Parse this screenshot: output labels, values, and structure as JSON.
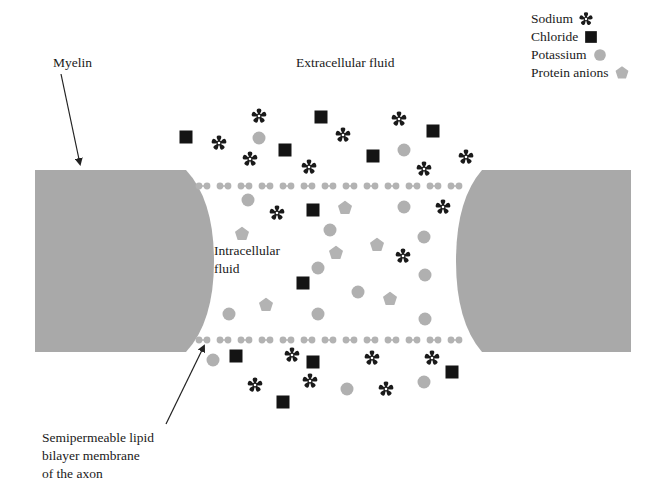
{
  "colors": {
    "myelin": "#a9a9a9",
    "membrane": "#b3b3b3",
    "sodium": "#1a1a1a",
    "chloride": "#141414",
    "potassium": "#b0b0b0",
    "protein": "#b3b3b3",
    "text": "#1a1a1a",
    "arrow": "#222222"
  },
  "labels": {
    "myelin": "Myelin",
    "extracellular": "Extracellular fluid",
    "intracellular_line1": "Intracellular",
    "intracellular_line2": "fluid",
    "membrane_line1": "Semipermeable lipid",
    "membrane_line2": "bilayer membrane",
    "membrane_line3": "of the axon"
  },
  "legend": {
    "items": [
      {
        "label": "Sodium",
        "symbol": "star"
      },
      {
        "label": "Chloride",
        "symbol": "square"
      },
      {
        "label": "Potassium",
        "symbol": "circle"
      },
      {
        "label": "Protein anions",
        "symbol": "pentagon"
      }
    ]
  },
  "particles": {
    "extracellular_top": [
      {
        "type": "square",
        "x": 186,
        "y": 137
      },
      {
        "type": "star",
        "x": 219,
        "y": 143
      },
      {
        "type": "star",
        "x": 259,
        "y": 116
      },
      {
        "type": "circle",
        "x": 259,
        "y": 138
      },
      {
        "type": "star",
        "x": 250,
        "y": 159
      },
      {
        "type": "square",
        "x": 285,
        "y": 150
      },
      {
        "type": "star",
        "x": 309,
        "y": 167
      },
      {
        "type": "square",
        "x": 321,
        "y": 117
      },
      {
        "type": "star",
        "x": 343,
        "y": 135
      },
      {
        "type": "square",
        "x": 373,
        "y": 156
      },
      {
        "type": "star",
        "x": 399,
        "y": 119
      },
      {
        "type": "square",
        "x": 433,
        "y": 131
      },
      {
        "type": "circle",
        "x": 404,
        "y": 150
      },
      {
        "type": "star",
        "x": 424,
        "y": 169
      },
      {
        "type": "star",
        "x": 466,
        "y": 157
      }
    ],
    "intracellular": [
      {
        "type": "circle",
        "x": 248,
        "y": 200
      },
      {
        "type": "star",
        "x": 277,
        "y": 213
      },
      {
        "type": "square",
        "x": 313,
        "y": 210
      },
      {
        "type": "pentagon",
        "x": 345,
        "y": 208
      },
      {
        "type": "circle",
        "x": 404,
        "y": 207
      },
      {
        "type": "star",
        "x": 443,
        "y": 207
      },
      {
        "type": "pentagon",
        "x": 242,
        "y": 234
      },
      {
        "type": "circle",
        "x": 330,
        "y": 230
      },
      {
        "type": "pentagon",
        "x": 377,
        "y": 245
      },
      {
        "type": "circle",
        "x": 424,
        "y": 237
      },
      {
        "type": "pentagon",
        "x": 336,
        "y": 253
      },
      {
        "type": "star",
        "x": 403,
        "y": 256
      },
      {
        "type": "circle",
        "x": 318,
        "y": 268
      },
      {
        "type": "circle",
        "x": 425,
        "y": 275
      },
      {
        "type": "square",
        "x": 303,
        "y": 283
      },
      {
        "type": "circle",
        "x": 358,
        "y": 292
      },
      {
        "type": "pentagon",
        "x": 390,
        "y": 299
      },
      {
        "type": "pentagon",
        "x": 266,
        "y": 305
      },
      {
        "type": "circle",
        "x": 229,
        "y": 314
      },
      {
        "type": "circle",
        "x": 318,
        "y": 314
      },
      {
        "type": "circle",
        "x": 425,
        "y": 319
      }
    ],
    "extracellular_bottom": [
      {
        "type": "circle",
        "x": 213,
        "y": 360
      },
      {
        "type": "square",
        "x": 236,
        "y": 356
      },
      {
        "type": "star",
        "x": 292,
        "y": 355
      },
      {
        "type": "square",
        "x": 313,
        "y": 362
      },
      {
        "type": "star",
        "x": 372,
        "y": 358
      },
      {
        "type": "star",
        "x": 432,
        "y": 358
      },
      {
        "type": "square",
        "x": 452,
        "y": 372
      },
      {
        "type": "star",
        "x": 255,
        "y": 385
      },
      {
        "type": "star",
        "x": 310,
        "y": 381
      },
      {
        "type": "circle",
        "x": 347,
        "y": 389
      },
      {
        "type": "star",
        "x": 386,
        "y": 389
      },
      {
        "type": "circle",
        "x": 424,
        "y": 382
      },
      {
        "type": "square",
        "x": 283,
        "y": 402
      }
    ]
  },
  "membrane": {
    "top_y": 186,
    "bottom_y": 340,
    "x_start": 199,
    "x_end": 462,
    "period": 21
  }
}
